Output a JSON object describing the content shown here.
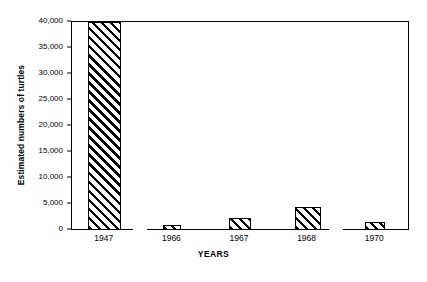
{
  "chart_data": {
    "type": "bar",
    "title": "",
    "xlabel": "YEARS",
    "ylabel": "Estimated numbers of turtles",
    "categories": [
      "1947",
      "1966",
      "1967",
      "1968",
      "1970"
    ],
    "values": [
      40000,
      1000,
      2400,
      4500,
      1500
    ],
    "ylim": [
      0,
      40000
    ],
    "yticks": [
      0,
      5000,
      10000,
      15000,
      20000,
      25000,
      30000,
      35000,
      40000
    ],
    "ytick_labels": [
      "0",
      "5,000",
      "10,000",
      "15,000",
      "20,000",
      "25,000",
      "30,000",
      "35,000",
      "40,000"
    ],
    "grid": false,
    "legend": null,
    "series": [
      {
        "name": "Estimated numbers of turtles",
        "values": [
          40000,
          1000,
          2400,
          4500,
          1500
        ],
        "fill": "diagonal-hatch",
        "fill_color": "#000000",
        "background_color": "#ffffff",
        "edge_color": "#000000"
      }
    ],
    "bar_groups": [
      {
        "label": "1947",
        "value": 40000
      },
      {
        "label": "1966",
        "value": 1000
      },
      {
        "label": "1967",
        "value": 2400
      },
      {
        "label": "1968",
        "value": 4500
      },
      {
        "label": "1970",
        "value": 1500
      }
    ]
  },
  "colors": {
    "axis": "#000000",
    "bar_hatch": "#000000",
    "background": "#ffffff"
  }
}
